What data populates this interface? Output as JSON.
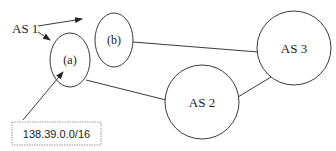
{
  "diagram": {
    "title": "",
    "colors": {
      "line": "#3a3a3a",
      "text": "#1a1a1a",
      "box_border": "#9a9a9a",
      "background": "#ffffff"
    },
    "label": {
      "text": "AS 1",
      "x": 12,
      "y": 32
    },
    "nodes": [
      {
        "id": "a",
        "label": "(a)",
        "shape": "ellipse",
        "cx": 70,
        "cy": 60,
        "rx": 20,
        "ry": 27
      },
      {
        "id": "b",
        "label": "(b)",
        "shape": "ellipse",
        "cx": 114,
        "cy": 40,
        "rx": 19,
        "ry": 27
      },
      {
        "id": "as2",
        "label": "AS 2",
        "shape": "circle",
        "cx": 202,
        "cy": 102,
        "r": 37
      },
      {
        "id": "as3",
        "label": "AS 3",
        "shape": "circle",
        "cx": 294,
        "cy": 48,
        "r": 37
      }
    ],
    "edges": [
      {
        "from": "b",
        "to": "as3"
      },
      {
        "from": "a",
        "to": "as2"
      },
      {
        "from": "as2",
        "to": "as3"
      }
    ],
    "arrows": [
      {
        "from": "AS 1",
        "to": "b",
        "kind": "pointer"
      },
      {
        "from": "AS 1",
        "to": "a",
        "kind": "pointer"
      },
      {
        "from": "prefix_box",
        "to": "a",
        "kind": "pointer"
      }
    ],
    "prefix_box": {
      "text": "138.39.0.0/16"
    }
  }
}
